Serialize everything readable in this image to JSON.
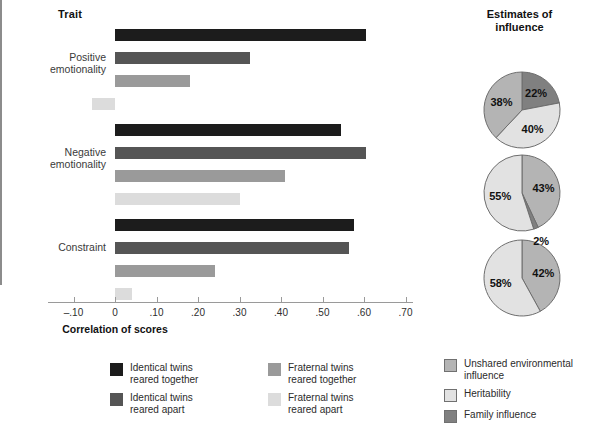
{
  "chart_data": {
    "type": "bar",
    "title": "",
    "xlabel": "Correlation of scores",
    "ylabel": "Trait",
    "xlim": [
      -0.1,
      0.7
    ],
    "grid": false,
    "legend_position": "bottom-left",
    "categories": [
      "Positive emotionality",
      "Negative emotionality",
      "Constraint"
    ],
    "tick_labels": [
      "–.10",
      "0",
      ".10",
      ".20",
      ".30",
      ".40",
      ".50",
      ".60",
      ".70"
    ],
    "tick_values": [
      -0.1,
      0,
      0.1,
      0.2,
      0.3,
      0.4,
      0.5,
      0.6,
      0.7
    ],
    "series": [
      {
        "name": "Identical twins reared together",
        "color": "#1c1c1c",
        "values": [
          0.605,
          0.545,
          0.575
        ]
      },
      {
        "name": "Identical twins reared apart",
        "color": "#555555",
        "values": [
          0.325,
          0.605,
          0.565
        ]
      },
      {
        "name": "Fraternal twins reared together",
        "color": "#9a9a9a",
        "values": [
          0.18,
          0.41,
          0.24
        ]
      },
      {
        "name": "Fraternal twins reared apart",
        "color": "#dcdcdc",
        "values": [
          -0.055,
          0.3,
          0.04
        ]
      }
    ]
  },
  "pie_charts": {
    "title": "Estimates of\ninfluence",
    "type": "pie",
    "charts": [
      {
        "trait": "Positive emotionality",
        "slices": [
          {
            "label": "22%",
            "value": 22,
            "category": "Family influence",
            "color": "#808080"
          },
          {
            "label": "40%",
            "value": 40,
            "category": "Heritability",
            "color": "#e2e2e2"
          },
          {
            "label": "38%",
            "value": 38,
            "category": "Unshared environmental influence",
            "color": "#b4b4b4"
          }
        ]
      },
      {
        "trait": "Negative emotionality",
        "slices": [
          {
            "label": "43%",
            "value": 43,
            "category": "Unshared environmental influence",
            "color": "#b4b4b4"
          },
          {
            "label": "2%",
            "value": 2,
            "category": "Family influence",
            "color": "#808080"
          },
          {
            "label": "55%",
            "value": 55,
            "category": "Heritability",
            "color": "#e2e2e2"
          }
        ]
      },
      {
        "trait": "Constraint",
        "slices": [
          {
            "label": "42%",
            "value": 42,
            "category": "Unshared environmental influence",
            "color": "#b4b4b4"
          },
          {
            "label": "58%",
            "value": 58,
            "category": "Heritability",
            "color": "#e2e2e2"
          }
        ]
      }
    ],
    "legend": [
      {
        "label": "Unshared environmental\ninfluence",
        "color": "#b4b4b4"
      },
      {
        "label": "Heritability",
        "color": "#e2e2e2"
      },
      {
        "label": "Family influence",
        "color": "#808080"
      }
    ]
  }
}
